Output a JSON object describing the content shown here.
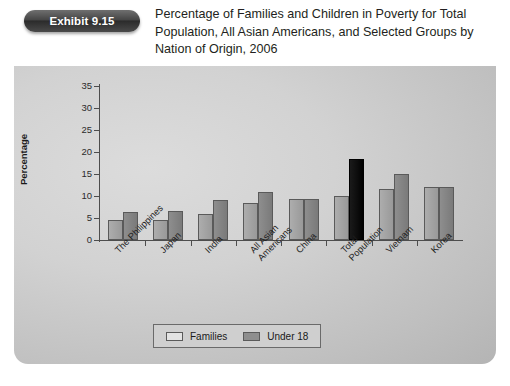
{
  "header": {
    "badge_label": "Exhibit 9.15",
    "title": "Percentage of Families and Children in Poverty for Total Population, All Asian Americans, and Selected Groups by Nation of Origin, 2006"
  },
  "legend": {
    "items": [
      {
        "label": "Families",
        "color": "#e3e3e3"
      },
      {
        "label": "Under 18",
        "color": "#8e8e8e"
      }
    ]
  },
  "colors": {
    "families_bar": "#a2a2a2",
    "under18_bar": "#838383",
    "highlight_bar": "#000000",
    "panel_background": "#d2d2d2",
    "axis": "#4d4d4d"
  },
  "chart_data": {
    "type": "bar",
    "title": "Percentage of Families and Children in Poverty for Total Population, All Asian Americans, and Selected Groups by Nation of Origin, 2006",
    "xlabel": "",
    "ylabel": "Percentage",
    "ylim": [
      0,
      35
    ],
    "yticks": [
      0,
      5,
      10,
      15,
      20,
      25,
      30,
      35
    ],
    "grid": false,
    "legend_position": "bottom",
    "categories": [
      "The Philippines",
      "Japan",
      "India",
      "All Asian Americans",
      "China",
      "Total Population",
      "Vietnam",
      "Korea"
    ],
    "category_lines": [
      [
        "The Philippines"
      ],
      [
        "Japan"
      ],
      [
        "India"
      ],
      [
        "All Asian",
        "Americans"
      ],
      [
        "China"
      ],
      [
        "Total",
        "Population"
      ],
      [
        "Vietnam"
      ],
      [
        "Korea"
      ]
    ],
    "series": [
      {
        "name": "Families",
        "values": [
          4.5,
          4.6,
          6.0,
          8.3,
          9.4,
          9.9,
          11.5,
          12.0
        ]
      },
      {
        "name": "Under 18",
        "values": [
          6.3,
          6.5,
          9.0,
          11.0,
          9.4,
          18.5,
          15.0,
          12.0
        ]
      }
    ],
    "highlighted": {
      "category": "Total Population",
      "series": "Under 18"
    }
  }
}
